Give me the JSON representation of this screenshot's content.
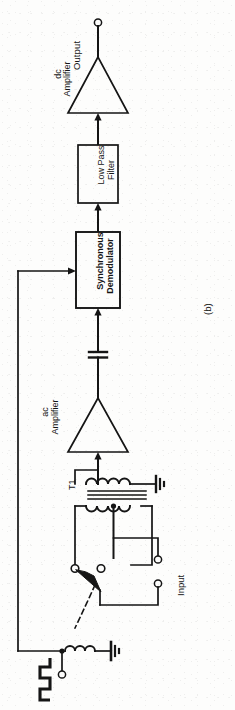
{
  "figure": {
    "caption": "(b)",
    "orientation": "rotated-90-ccw",
    "kind": "circuit-block-diagram",
    "page_background": "#fdfdfc",
    "ink_color": "#151515"
  },
  "labels": {
    "output": "Output",
    "dc_amplifier": "dc\nAmplifier",
    "low_pass_filter": "Low Pass\nFilter",
    "synchronous_demodulator": "Synchronous\nDemodulator",
    "ac_amplifier": "ac\nAmplifier",
    "transformer": "T1",
    "input": "Input"
  },
  "blocks": [
    {
      "id": "low-pass-filter",
      "label": "Low Pass\nFilter",
      "shape": "rectangle"
    },
    {
      "id": "synchronous-demodulator",
      "label": "Synchronous\nDemodulator",
      "shape": "rectangle"
    },
    {
      "id": "dc-amplifier",
      "label": "dc\nAmplifier",
      "shape": "triangle"
    },
    {
      "id": "ac-amplifier",
      "label": "ac\nAmplifier",
      "shape": "triangle"
    }
  ],
  "components": [
    {
      "id": "output-terminal",
      "type": "terminal-circle"
    },
    {
      "id": "coupling-capacitor",
      "type": "capacitor"
    },
    {
      "id": "transformer-t1",
      "type": "transformer",
      "label": "T1"
    },
    {
      "id": "transformer-secondary-ground",
      "type": "ground"
    },
    {
      "id": "chopper-switch",
      "type": "spdt-switch"
    },
    {
      "id": "relay-coil",
      "type": "inductor-coil"
    },
    {
      "id": "relay-coil-ground",
      "type": "ground"
    },
    {
      "id": "square-wave-source",
      "type": "square-wave-symbol"
    },
    {
      "id": "square-wave-terminal",
      "type": "terminal-circle"
    },
    {
      "id": "input-terminal-top",
      "type": "terminal-circle"
    },
    {
      "id": "input-terminal-bottom",
      "type": "terminal-circle"
    },
    {
      "id": "switch-contact-left",
      "type": "terminal-circle"
    },
    {
      "id": "switch-contact-right",
      "type": "terminal-circle"
    }
  ],
  "signal_flow": [
    "Input",
    "chopper-switch",
    "transformer-t1",
    "ac-amplifier",
    "coupling-capacitor",
    "synchronous-demodulator",
    "low-pass-filter",
    "dc-amplifier",
    "Output"
  ],
  "reference_path": "square-wave-source -> synchronous-demodulator"
}
